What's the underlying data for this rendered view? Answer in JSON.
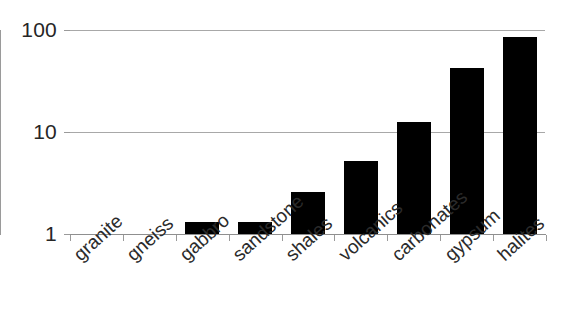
{
  "chart_data": {
    "type": "bar",
    "title": "",
    "subtitle": "",
    "xlabel": "",
    "ylabel": "",
    "scale": "log",
    "grid": true,
    "legend": false,
    "categories": [
      "granite",
      "gneiss",
      "gabbro",
      "sandstone",
      "shales",
      "volcanics",
      "carbonates",
      "gypsum",
      "halites"
    ],
    "values": [
      0,
      0,
      1.3,
      1.3,
      2.6,
      5.2,
      12.5,
      42,
      85
    ],
    "ylim": [
      1,
      100
    ],
    "yticks": [
      1,
      10,
      100
    ],
    "ytick_labels": [
      "1",
      "10",
      "100"
    ],
    "bar_color": "#000000",
    "grid_color": "#a8a8a8",
    "axis_color": "#9a9a9a",
    "background": "#ffffff"
  },
  "axes": {
    "y_ticks": [
      {
        "label": "100",
        "value": 100
      },
      {
        "label": "10",
        "value": 10
      },
      {
        "label": "1",
        "value": 1
      }
    ]
  }
}
